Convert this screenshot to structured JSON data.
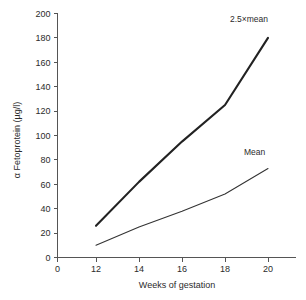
{
  "chart_data": {
    "type": "line",
    "title": "",
    "xlabel": "Weeks of gestation",
    "ylabel": "α Fetoprotein (µg/l)",
    "x": [
      12,
      14,
      16,
      18,
      20
    ],
    "xlim": [
      0,
      21
    ],
    "ylim": [
      0,
      200
    ],
    "x_ticks": [
      "0",
      "12",
      "14",
      "16",
      "18",
      "20"
    ],
    "x_tick_values": [
      0,
      12,
      14,
      16,
      18,
      20
    ],
    "y_ticks": [
      "0",
      "20",
      "40",
      "60",
      "80",
      "100",
      "120",
      "140",
      "160",
      "180",
      "200"
    ],
    "y_tick_values": [
      0,
      20,
      40,
      60,
      80,
      100,
      120,
      140,
      160,
      180,
      200
    ],
    "grid": false,
    "legend_position": "inline-annotations",
    "x_axis_broken": true,
    "series": [
      {
        "name": "2.5×mean",
        "annotation": "2.5×mean",
        "values": [
          26,
          62,
          95,
          125,
          180
        ],
        "style": "thick"
      },
      {
        "name": "Mean",
        "annotation": "Mean",
        "values": [
          10,
          25,
          38,
          52,
          73
        ],
        "style": "thin"
      }
    ],
    "annotations": [
      {
        "text": "2.5×mean",
        "x_px": 230,
        "y_px": 22
      },
      {
        "text": "Mean",
        "x_px": 244,
        "y_px": 155
      }
    ],
    "colors": {
      "line_primary": "#222222",
      "line_secondary": "#333333",
      "axis": "#555555",
      "text": "#2b2b2b",
      "background": "#ffffff"
    }
  }
}
